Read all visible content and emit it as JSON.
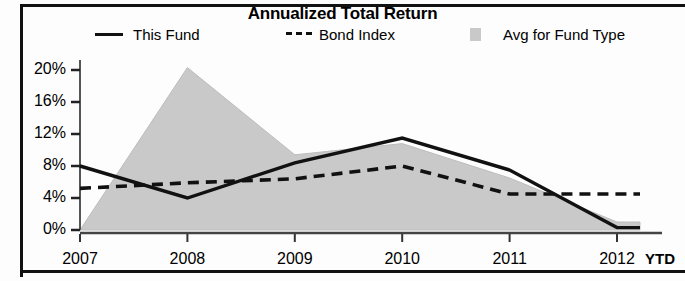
{
  "chart_data": {
    "type": "area",
    "title": "Annualized Total Return",
    "xlabel": "",
    "ylabel": "",
    "x_axis_note": "YTD",
    "categories": [
      "2007",
      "2008",
      "2009",
      "2010",
      "2011",
      "2012"
    ],
    "ytick_labels": [
      "0%",
      "4%",
      "8%",
      "12%",
      "16%",
      "20%"
    ],
    "ytick_values": [
      0,
      4,
      8,
      12,
      16,
      20
    ],
    "ylim": [
      0,
      21.5
    ],
    "grid": false,
    "legend_position": "top",
    "series": [
      {
        "name": "This Fund",
        "style": "solid-line",
        "color": "#111111",
        "values": [
          8.0,
          4.0,
          8.4,
          11.5,
          7.5,
          0.3
        ]
      },
      {
        "name": "Bond Index",
        "style": "dashed-line",
        "color": "#111111",
        "values": [
          5.2,
          5.9,
          6.4,
          8.0,
          4.5,
          4.5
        ]
      },
      {
        "name": "Avg for Fund Type",
        "style": "filled-area",
        "color": "#c9c9c9",
        "values": [
          0.0,
          20.3,
          9.4,
          10.8,
          6.5,
          1.0
        ]
      }
    ]
  },
  "legend": {
    "items": [
      {
        "label": "This Fund",
        "swatch": "solid-line-swatch"
      },
      {
        "label": "Bond Index",
        "swatch": "dashed-line-swatch"
      },
      {
        "label": "Avg for Fund Type",
        "swatch": "gray-square-swatch"
      }
    ]
  },
  "colors": {
    "area_fill": "#c9c9c9",
    "line": "#111111",
    "frame": "#111111",
    "background": "#fdfdfd"
  }
}
